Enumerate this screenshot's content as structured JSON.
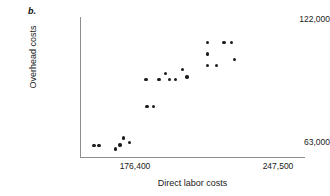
{
  "figure": {
    "panel_label": "b."
  },
  "chart_data": {
    "type": "scatter",
    "title": "",
    "xlabel": "Direct labor costs",
    "ylabel": "Overhead costs",
    "xtick_labels": [
      "176,400",
      "247,500"
    ],
    "xtick_values": [
      176400,
      247500
    ],
    "ytick_labels": [
      "63,000",
      "122,000"
    ],
    "ytick_values": [
      63000,
      122000
    ],
    "xlim": [
      158000,
      262000
    ],
    "ylim": [
      58000,
      126000
    ],
    "grid": false,
    "legend": null,
    "marker": "filled-circle",
    "marker_color": "#1c1c1c",
    "points": [
      {
        "x": 164500,
        "y": 63600
      },
      {
        "x": 166800,
        "y": 63600
      },
      {
        "x": 174300,
        "y": 61800
      },
      {
        "x": 176500,
        "y": 63800
      },
      {
        "x": 178200,
        "y": 67300
      },
      {
        "x": 181000,
        "y": 65000
      },
      {
        "x": 189000,
        "y": 82500
      },
      {
        "x": 192000,
        "y": 82500
      },
      {
        "x": 188500,
        "y": 95500
      },
      {
        "x": 194500,
        "y": 95500
      },
      {
        "x": 197500,
        "y": 98500
      },
      {
        "x": 199500,
        "y": 95500
      },
      {
        "x": 202000,
        "y": 95500
      },
      {
        "x": 205500,
        "y": 100500
      },
      {
        "x": 207500,
        "y": 96800
      },
      {
        "x": 217000,
        "y": 113500
      },
      {
        "x": 217000,
        "y": 108000
      },
      {
        "x": 217000,
        "y": 102500
      },
      {
        "x": 221000,
        "y": 102500
      },
      {
        "x": 224500,
        "y": 113500
      },
      {
        "x": 228000,
        "y": 113500
      },
      {
        "x": 229500,
        "y": 105500
      }
    ]
  }
}
